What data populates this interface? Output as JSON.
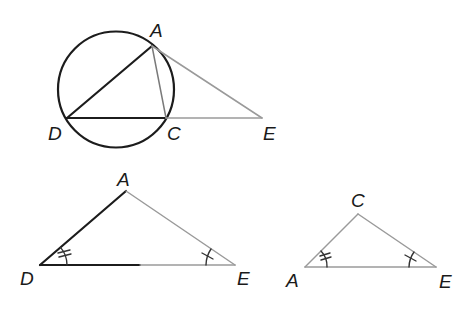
{
  "figure1": {
    "description": "Circle with inscribed triangle ADC and external point E on extension of DC",
    "labels": {
      "A": "A",
      "D": "D",
      "C": "C",
      "E": "E"
    }
  },
  "figure2": {
    "description": "Triangle DAE with angle D marked double and angle E marked single",
    "labels": {
      "A": "A",
      "D": "D",
      "E": "E"
    },
    "angle_marks": {
      "D": "double",
      "E": "single"
    }
  },
  "figure3": {
    "description": "Triangle ACE with angle A marked double and angle E marked single",
    "labels": {
      "C": "C",
      "A": "A",
      "E": "E"
    },
    "angle_marks": {
      "A": "double",
      "E": "single"
    }
  },
  "colors": {
    "stroke_dark": "#1c1c1c",
    "stroke_light": "#9a9a9a",
    "background": "#ffffff"
  }
}
